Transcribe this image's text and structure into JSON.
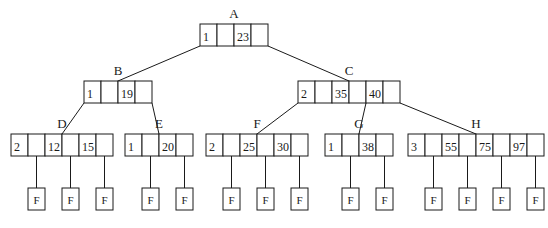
{
  "diagram": {
    "type": "b-tree",
    "leaf_label": "F",
    "nodes": [
      {
        "id": "A",
        "label": "A",
        "keys": [
          "1",
          "23"
        ],
        "x": 200,
        "y": 24,
        "cells": 4,
        "level": 0
      },
      {
        "id": "B",
        "label": "B",
        "keys": [
          "1",
          "19"
        ],
        "x": 84,
        "y": 81,
        "cells": 4,
        "level": 1
      },
      {
        "id": "C",
        "label": "C",
        "keys": [
          "2",
          "35",
          "40"
        ],
        "x": 298,
        "y": 81,
        "cells": 6,
        "level": 1
      },
      {
        "id": "D",
        "label": "D",
        "keys": [
          "2",
          "12",
          "15"
        ],
        "x": 11,
        "y": 134,
        "cells": 6,
        "level": 2
      },
      {
        "id": "E",
        "label": "E",
        "keys": [
          "1",
          "20"
        ],
        "x": 125,
        "y": 134,
        "cells": 4,
        "level": 2
      },
      {
        "id": "F",
        "label": "F",
        "keys": [
          "2",
          "25",
          "30"
        ],
        "x": 206,
        "y": 134,
        "cells": 6,
        "level": 2
      },
      {
        "id": "G",
        "label": "G",
        "keys": [
          "1",
          "38"
        ],
        "x": 325,
        "y": 134,
        "cells": 4,
        "level": 2
      },
      {
        "id": "H",
        "label": "H",
        "keys": [
          "3",
          "55",
          "75",
          "97"
        ],
        "x": 408,
        "y": 134,
        "cells": 8,
        "level": 2
      }
    ],
    "edges": [
      {
        "from": "A",
        "to": "B"
      },
      {
        "from": "A",
        "to": "C"
      },
      {
        "from": "B",
        "to": "D"
      },
      {
        "from": "B",
        "to": "E"
      },
      {
        "from": "C",
        "to": "F"
      },
      {
        "from": "C",
        "to": "G"
      },
      {
        "from": "C",
        "to": "H"
      }
    ],
    "leaves": [
      {
        "parent": "D",
        "x": 27
      },
      {
        "parent": "D",
        "x": 62
      },
      {
        "parent": "D",
        "x": 93
      },
      {
        "parent": "E",
        "x": 142
      },
      {
        "parent": "E",
        "x": 177
      },
      {
        "parent": "F",
        "x": 222
      },
      {
        "parent": "F",
        "x": 256
      },
      {
        "parent": "F",
        "x": 291
      },
      {
        "parent": "G",
        "x": 341
      },
      {
        "parent": "G",
        "x": 376
      },
      {
        "parent": "H",
        "x": 424
      },
      {
        "parent": "H",
        "x": 457
      },
      {
        "parent": "H",
        "x": 490
      },
      {
        "parent": "H",
        "x": 524
      }
    ]
  }
}
